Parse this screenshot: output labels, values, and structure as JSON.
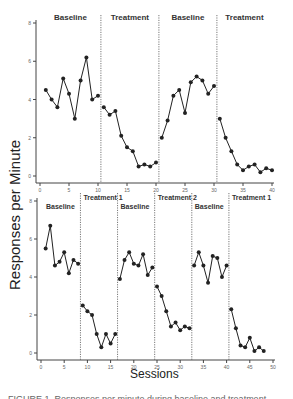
{
  "chart_data": [
    {
      "type": "line",
      "panel": "top",
      "title": "",
      "xlabel": "",
      "ylabel": "Responses per Minute",
      "xlim": [
        0,
        40
      ],
      "ylim": [
        0,
        8
      ],
      "xticks": [
        0,
        5,
        10,
        15,
        20,
        25,
        30,
        35,
        40
      ],
      "yticks": [
        0,
        2,
        4,
        6,
        8
      ],
      "grid": false,
      "phase_lines": [
        10.5,
        20.5,
        30.5
      ],
      "phases": [
        {
          "label": "Baseline",
          "sessions": [
            1,
            2,
            3,
            4,
            5,
            6,
            7,
            8,
            9,
            10
          ],
          "values": [
            4.5,
            4.0,
            3.6,
            5.1,
            4.3,
            3.0,
            5.0,
            6.2,
            4.0,
            4.2
          ]
        },
        {
          "label": "Treatment",
          "sessions": [
            11,
            12,
            13,
            14,
            15,
            16,
            17,
            18,
            19,
            20
          ],
          "values": [
            3.6,
            3.2,
            3.4,
            2.1,
            1.5,
            1.3,
            0.5,
            0.6,
            0.5,
            0.7
          ]
        },
        {
          "label": "Baseline",
          "sessions": [
            21,
            22,
            23,
            24,
            25,
            26,
            27,
            28,
            29,
            30
          ],
          "values": [
            2.0,
            2.9,
            4.2,
            4.5,
            3.3,
            4.9,
            5.2,
            5.0,
            4.3,
            4.7
          ]
        },
        {
          "label": "Treatment",
          "sessions": [
            31,
            32,
            33,
            34,
            35,
            36,
            37,
            38,
            39,
            40
          ],
          "values": [
            3.0,
            2.0,
            1.3,
            0.6,
            0.3,
            0.5,
            0.6,
            0.2,
            0.4,
            0.3
          ]
        }
      ]
    },
    {
      "type": "line",
      "panel": "bottom",
      "title": "",
      "xlabel": "Sessions",
      "ylabel": "Responses per Minute",
      "xlim": [
        0,
        50
      ],
      "ylim": [
        0,
        8
      ],
      "xticks": [
        0,
        5,
        10,
        15,
        20,
        25,
        30,
        35,
        40,
        45,
        50
      ],
      "yticks": [
        0,
        2,
        4,
        6,
        8
      ],
      "grid": false,
      "phase_lines": [
        8.5,
        16.5,
        24.5,
        32.5,
        40.5
      ],
      "phases": [
        {
          "label": "Baseline",
          "sessions": [
            1,
            2,
            3,
            4,
            5,
            6,
            7,
            8
          ],
          "values": [
            5.5,
            6.7,
            4.6,
            4.8,
            5.3,
            4.2,
            4.9,
            4.7
          ]
        },
        {
          "label": "Treatment  1",
          "sessions": [
            9,
            10,
            11,
            12,
            13,
            14,
            15,
            16
          ],
          "values": [
            2.5,
            2.2,
            2.0,
            1.0,
            0.3,
            1.0,
            0.5,
            1.0
          ]
        },
        {
          "label": "Baseline",
          "sessions": [
            17,
            18,
            19,
            20,
            21,
            22,
            23,
            24
          ],
          "values": [
            3.9,
            4.9,
            5.3,
            4.7,
            4.6,
            5.2,
            4.1,
            4.5
          ]
        },
        {
          "label": "Treatment  2",
          "sessions": [
            25,
            26,
            27,
            28,
            29,
            30,
            31,
            32
          ],
          "values": [
            3.5,
            3.0,
            2.2,
            1.4,
            1.6,
            1.2,
            1.4,
            1.3
          ]
        },
        {
          "label": "Baseline",
          "sessions": [
            33,
            34,
            35,
            36,
            37,
            38,
            39,
            40
          ],
          "values": [
            4.6,
            5.3,
            4.6,
            3.7,
            5.1,
            5.0,
            4.0,
            4.6
          ]
        },
        {
          "label": "Treatment  1",
          "sessions": [
            41,
            42,
            43,
            44,
            45,
            46,
            47,
            48
          ],
          "values": [
            2.3,
            1.3,
            0.4,
            0.3,
            0.8,
            0.1,
            0.3,
            0.1
          ]
        }
      ]
    }
  ],
  "labels": {
    "y_axis": "Responses per Minute",
    "x_axis": "Sessions",
    "caption": "FIGURE 1. Responses per minute during baseline and treatment phases."
  },
  "colors": {
    "line": "#222222",
    "axis": "#444444",
    "phase_line": "#555555",
    "tick_text": "#666666"
  }
}
